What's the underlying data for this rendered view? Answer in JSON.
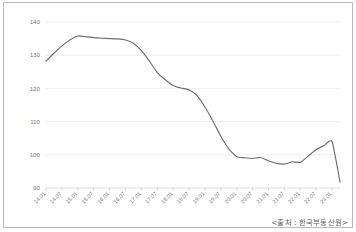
{
  "figure": {
    "background_color": "#ffffff",
    "border_color": "#b9b9b9",
    "source_note": "<출처 : 한국부동산원>"
  },
  "chart_data": {
    "type": "line",
    "title": "",
    "subtitle": "",
    "xlabel": "",
    "ylabel": "",
    "ylim": [
      90,
      140
    ],
    "yticks": [
      90,
      100,
      110,
      120,
      130,
      140
    ],
    "ytick_labels": [
      "90",
      "100",
      "110",
      "120",
      "130",
      "140"
    ],
    "grid": true,
    "grid_color": "#e6e6e6",
    "legend": false,
    "legend_position": "none",
    "line_color": "#6e6e6e",
    "xtick_labels": [
      "14.01",
      "14.07",
      "15.01",
      "15.07",
      "16.01",
      "16.07",
      "17.01",
      "17.07",
      "18.01",
      "18.07",
      "19.01",
      "19.07",
      "20.01",
      "20.07",
      "21.01",
      "21.07",
      "22.01",
      "22.07",
      "23.01"
    ],
    "x": [
      "14.01",
      "14.04",
      "14.07",
      "14.10",
      "15.01",
      "15.04",
      "15.07",
      "15.10",
      "16.01",
      "16.04",
      "16.07",
      "16.10",
      "17.01",
      "17.04",
      "17.07",
      "17.10",
      "18.01",
      "18.04",
      "18.07",
      "18.10",
      "19.01",
      "19.04",
      "19.07",
      "19.10",
      "20.01",
      "20.04",
      "20.07",
      "20.10",
      "21.01",
      "21.04",
      "21.07",
      "21.10",
      "22.01",
      "22.04",
      "22.07",
      "22.10",
      "23.01",
      "23.04"
    ],
    "values": [
      128.2,
      130.6,
      132.8,
      134.6,
      135.8,
      135.6,
      135.3,
      135.1,
      135.0,
      134.9,
      134.6,
      133.6,
      131.4,
      128.3,
      124.8,
      122.6,
      120.9,
      120.1,
      119.6,
      117.8,
      114.4,
      110.2,
      105.6,
      101.8,
      99.4,
      99.1,
      98.9,
      99.2,
      98.2,
      97.4,
      97.2,
      97.9,
      97.7,
      99.6,
      101.6,
      102.8,
      104.0,
      91.8
    ],
    "annotations": []
  }
}
